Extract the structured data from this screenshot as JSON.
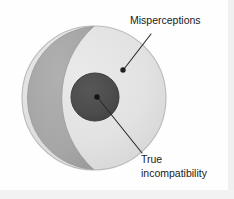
{
  "figure": {
    "type": "venn-nested-diagram",
    "caption_labels": {
      "outer_label": "Misperceptions",
      "inner_label_line1": "True",
      "inner_label_line2": "incompatibility",
      "inner_label_full": "True incompatibility"
    },
    "regions": [
      {
        "name": "outer-circle",
        "meaning": "Misperceptions",
        "shape": "circle",
        "center": [
          94,
          98
        ],
        "radius": 72,
        "fill": "#e3e3e3",
        "stroke": "#b8b8b8"
      },
      {
        "name": "lens-band",
        "meaning": "overlap band",
        "shape": "lens",
        "fill": "#a8a8a8",
        "stroke": "#9a9a9a"
      },
      {
        "name": "inner-circle",
        "meaning": "True incompatibility",
        "shape": "circle",
        "center": [
          95,
          97
        ],
        "radius": 24,
        "fill": "#4d4d4d",
        "stroke": "#3c3c3c"
      }
    ],
    "leaders": [
      {
        "name": "misperceptions-leader",
        "from": [
          151,
          33
        ],
        "to": [
          123,
          70
        ],
        "dot_at": [
          123,
          70
        ],
        "dot_radius": 2.6,
        "color": "#2a2a2a"
      },
      {
        "name": "true-incompatibility-leader",
        "from": [
          97,
          97
        ],
        "to": [
          143,
          155
        ],
        "dot_at": [
          97,
          97
        ],
        "dot_radius": 2.6,
        "color": "#2a2a2a"
      }
    ],
    "colors": {
      "background": "#fefefe",
      "outer_fill": "#e3e3e3",
      "band_fill": "#a8a8a8",
      "inner_fill": "#4d4d4d",
      "text": "#1b1b1b",
      "leader_line": "#2a2a2a",
      "page_edge": "#cfcfcf"
    }
  }
}
